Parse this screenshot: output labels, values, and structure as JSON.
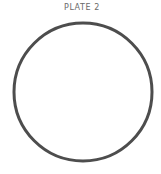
{
  "plate": {
    "label": "PLATE 2"
  },
  "figure": {
    "shape": "circle",
    "center_x": 83,
    "center_y": 92,
    "radius": 69,
    "stroke_width": 3,
    "stroke_color": "#4d4d4d",
    "fill": "none"
  }
}
